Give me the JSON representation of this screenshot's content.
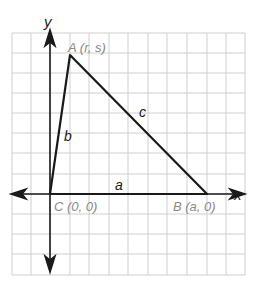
{
  "diagram": {
    "type": "coordinate-plane-triangle",
    "axes": {
      "x_label": "x",
      "y_label": "y"
    },
    "vertices": [
      {
        "name": "A",
        "label": "A (r, s)",
        "coords": "(r, s)"
      },
      {
        "name": "B",
        "label": "B (a, 0)",
        "coords": "(a, 0)"
      },
      {
        "name": "C",
        "label": "C (0, 0)",
        "coords": "(0, 0)"
      }
    ],
    "sides": [
      {
        "name": "a",
        "label": "a",
        "between": "C-B"
      },
      {
        "name": "b",
        "label": "b",
        "between": "C-A"
      },
      {
        "name": "c",
        "label": "c",
        "between": "A-B"
      }
    ],
    "colors": {
      "grid": "#c8c8c8",
      "lines": "#1a1a1a",
      "vertex_labels": "#8a8a8a"
    }
  }
}
